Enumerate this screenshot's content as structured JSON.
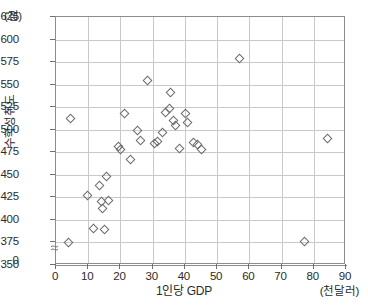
{
  "chart_data": {
    "type": "scatter",
    "title": "",
    "xlabel": "1인당 GDP",
    "ylabel": "수학성취도",
    "x_unit": "(천달러)",
    "y_unit": "(점)",
    "xlim": [
      0,
      90
    ],
    "ylim": [
      350,
      625
    ],
    "y_axis_break": true,
    "y_axis_break_label": "0",
    "grid": true,
    "legend": "none",
    "xticks": [
      0,
      10,
      20,
      30,
      40,
      50,
      60,
      70,
      80,
      90
    ],
    "yticks": [
      350,
      375,
      400,
      425,
      450,
      475,
      500,
      525,
      550,
      575,
      600,
      625
    ],
    "marker": "open-diamond",
    "marker_color": "#6b6b6b",
    "points": [
      {
        "x": 4.0,
        "y": 374
      },
      {
        "x": 4.5,
        "y": 512
      },
      {
        "x": 9.8,
        "y": 427
      },
      {
        "x": 11.8,
        "y": 390
      },
      {
        "x": 13.5,
        "y": 438
      },
      {
        "x": 14.3,
        "y": 420
      },
      {
        "x": 14.6,
        "y": 412
      },
      {
        "x": 15.3,
        "y": 389
      },
      {
        "x": 15.8,
        "y": 448
      },
      {
        "x": 16.6,
        "y": 421
      },
      {
        "x": 19.4,
        "y": 481
      },
      {
        "x": 20.2,
        "y": 477
      },
      {
        "x": 21.5,
        "y": 517
      },
      {
        "x": 23.4,
        "y": 466
      },
      {
        "x": 25.3,
        "y": 499
      },
      {
        "x": 26.4,
        "y": 488
      },
      {
        "x": 28.7,
        "y": 554
      },
      {
        "x": 30.6,
        "y": 484
      },
      {
        "x": 31.8,
        "y": 486
      },
      {
        "x": 33.3,
        "y": 496
      },
      {
        "x": 34.2,
        "y": 519
      },
      {
        "x": 35.3,
        "y": 523
      },
      {
        "x": 35.6,
        "y": 541
      },
      {
        "x": 36.5,
        "y": 510
      },
      {
        "x": 37.1,
        "y": 504
      },
      {
        "x": 38.4,
        "y": 479
      },
      {
        "x": 40.4,
        "y": 517
      },
      {
        "x": 41.0,
        "y": 508
      },
      {
        "x": 42.7,
        "y": 485
      },
      {
        "x": 44.0,
        "y": 483
      },
      {
        "x": 45.2,
        "y": 477
      },
      {
        "x": 57.2,
        "y": 578
      },
      {
        "x": 77.2,
        "y": 375
      },
      {
        "x": 84.3,
        "y": 490
      }
    ]
  }
}
